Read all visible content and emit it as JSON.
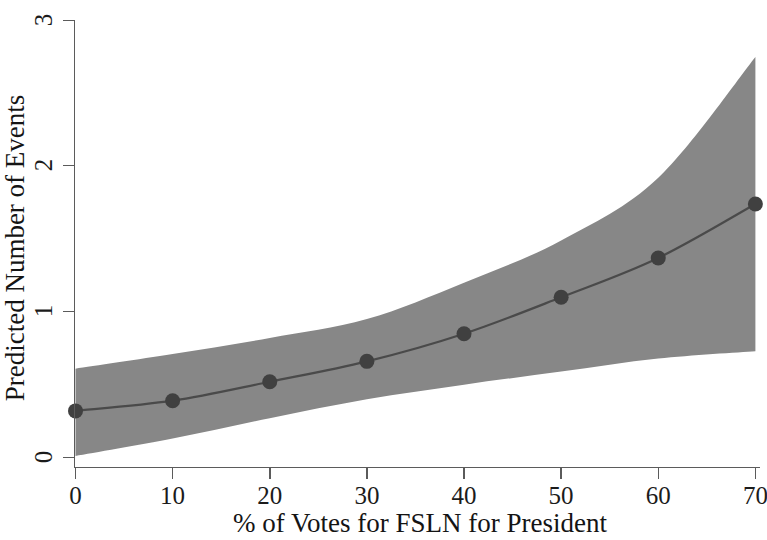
{
  "chart_data": {
    "type": "line",
    "title": "",
    "subtitle": "",
    "xlabel": "% of Votes for FSLN for President",
    "ylabel": "Predicted Number of Events",
    "xlim": [
      0,
      70
    ],
    "ylim": [
      0,
      3
    ],
    "xticks": [
      0,
      10,
      20,
      30,
      40,
      50,
      60,
      70
    ],
    "xtick_labels": [
      "0",
      "10",
      "20",
      "30",
      "40",
      "50",
      "60",
      "70"
    ],
    "yticks": [
      0,
      1,
      2,
      3
    ],
    "ytick_labels": [
      "0",
      "1",
      "2",
      "3"
    ],
    "grid": false,
    "legend": null,
    "legend_position": "none",
    "annotations": [],
    "x": [
      0,
      10,
      20,
      30,
      40,
      50,
      60,
      70
    ],
    "series": [
      {
        "name": "Predicted Number of Events",
        "kind": "line-with-markers",
        "values": [
          0.32,
          0.39,
          0.52,
          0.66,
          0.85,
          1.1,
          1.37,
          1.74
        ],
        "color": "#4a4a4a",
        "marker": "circle"
      }
    ],
    "confidence_band": {
      "name": "95% Confidence Interval",
      "color": "#878787",
      "x": [
        0,
        10,
        20,
        30,
        40,
        50,
        60,
        70
      ],
      "lower": [
        0.01,
        0.13,
        0.27,
        0.4,
        0.5,
        0.59,
        0.68,
        0.73
      ],
      "upper": [
        0.61,
        0.71,
        0.82,
        0.95,
        1.2,
        1.49,
        1.92,
        2.75
      ]
    }
  },
  "colors": {
    "background": "#ffffff",
    "band": "#878787",
    "line": "#4a4a4a",
    "marker": "#404040",
    "axis": "#5b5b5b",
    "text": "#141414"
  },
  "axes": {
    "x_title": "% of Votes for FSLN for President",
    "y_title": "Predicted Number of Events",
    "x_tick_0": "0",
    "x_tick_1": "10",
    "x_tick_2": "20",
    "x_tick_3": "30",
    "x_tick_4": "40",
    "x_tick_5": "50",
    "x_tick_6": "60",
    "x_tick_7": "70",
    "y_tick_0": "0",
    "y_tick_1": "1",
    "y_tick_2": "2",
    "y_tick_3": "3"
  }
}
